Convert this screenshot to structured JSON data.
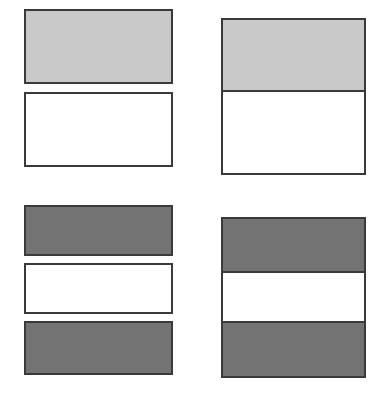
{
  "figure": {
    "canvas": {
      "width": 389,
      "height": 396,
      "background": "#ffffff"
    }
  },
  "palette": {
    "light_gray_fill": "#c9c9c9",
    "dark_gray_fill": "#737373",
    "white_fill": "#ffffff",
    "border": "#3a3a3a",
    "page_background": "#ffffff"
  },
  "panels": [
    {
      "id": "top-left",
      "name": "separated-two-band-light",
      "layout": "separated",
      "position": {
        "x": 24,
        "y": 9,
        "width": 149,
        "height": 158
      },
      "bands": [
        {
          "name": "band-light-upper",
          "fill": "#c9c9c9",
          "shade": "light-gray",
          "x": 24,
          "y": 9,
          "width": 149,
          "height": 75
        },
        {
          "name": "band-white-lower",
          "fill": "#ffffff",
          "shade": "white",
          "x": 24,
          "y": 92,
          "width": 149,
          "height": 75
        }
      ]
    },
    {
      "id": "top-right",
      "name": "contiguous-two-band-light",
      "layout": "contiguous",
      "position": {
        "x": 221,
        "y": 18,
        "width": 145,
        "height": 157
      },
      "bands": [
        {
          "name": "band-light-upper",
          "fill": "#c9c9c9",
          "shade": "light-gray",
          "height": 72
        },
        {
          "name": "band-white-lower",
          "fill": "#ffffff",
          "shade": "white",
          "height": 85
        }
      ]
    },
    {
      "id": "bottom-left",
      "name": "separated-three-band-dark",
      "layout": "separated",
      "position": {
        "x": 24,
        "y": 205,
        "width": 149,
        "height": 170
      },
      "bands": [
        {
          "name": "band-dark-upper",
          "fill": "#737373",
          "shade": "dark-gray",
          "x": 24,
          "y": 205,
          "width": 149,
          "height": 51
        },
        {
          "name": "band-white-middle",
          "fill": "#ffffff",
          "shade": "white",
          "x": 24,
          "y": 263,
          "width": 149,
          "height": 51
        },
        {
          "name": "band-dark-lower",
          "fill": "#737373",
          "shade": "dark-gray",
          "x": 24,
          "y": 321,
          "width": 149,
          "height": 54
        }
      ]
    },
    {
      "id": "bottom-right",
      "name": "contiguous-three-band-dark",
      "layout": "contiguous",
      "position": {
        "x": 221,
        "y": 217,
        "width": 145,
        "height": 161
      },
      "bands": [
        {
          "name": "band-dark-upper",
          "fill": "#737373",
          "shade": "dark-gray",
          "height": 53
        },
        {
          "name": "band-white-middle",
          "fill": "#ffffff",
          "shade": "white",
          "height": 52
        },
        {
          "name": "band-dark-lower",
          "fill": "#737373",
          "shade": "dark-gray",
          "height": 56
        }
      ]
    }
  ]
}
